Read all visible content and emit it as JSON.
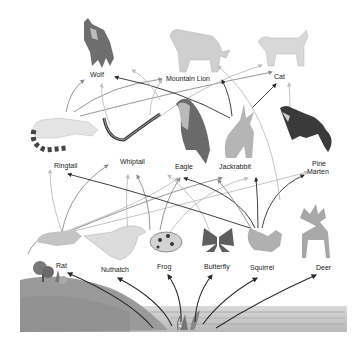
{
  "diagram": {
    "type": "food-web",
    "producer": "Plants",
    "organisms": [
      {
        "id": "wolf",
        "label": "Wolf",
        "level": "top",
        "x": 100,
        "y": 74
      },
      {
        "id": "mountain_lion",
        "label": "Mountain Lion",
        "level": "top",
        "x": 198,
        "y": 78
      },
      {
        "id": "cat",
        "label": "Cat",
        "level": "top",
        "x": 281,
        "y": 76
      },
      {
        "id": "ringtail",
        "label": "Ringtail",
        "level": "secondary",
        "x": 67,
        "y": 165
      },
      {
        "id": "whiptail",
        "label": "Whiptail",
        "level": "secondary",
        "x": 134,
        "y": 161
      },
      {
        "id": "eagle",
        "label": "Eagle",
        "level": "secondary",
        "x": 185,
        "y": 166
      },
      {
        "id": "jackrabbit",
        "label": "Jackrabbit",
        "level": "secondary",
        "x": 233,
        "y": 166
      },
      {
        "id": "pine_marten",
        "label": "Pine\nMarten",
        "level": "secondary",
        "x": 320,
        "y": 168
      },
      {
        "id": "rat",
        "label": "Rat",
        "level": "primary",
        "x": 62,
        "y": 265
      },
      {
        "id": "nuthatch",
        "label": "Nuthatch",
        "level": "primary",
        "x": 116,
        "y": 269
      },
      {
        "id": "frog",
        "label": "Frog",
        "level": "primary",
        "x": 165,
        "y": 266
      },
      {
        "id": "butterfly",
        "label": "Butterfly",
        "level": "primary",
        "x": 216,
        "y": 266
      },
      {
        "id": "squirrel",
        "label": "Squirrel",
        "level": "primary",
        "x": 262,
        "y": 267
      },
      {
        "id": "deer",
        "label": "Deer",
        "level": "primary",
        "x": 322,
        "y": 267
      }
    ],
    "labels": {
      "wolf": "Wolf",
      "mountain_lion": "Mountain Lion",
      "cat": "Cat",
      "ringtail": "Ringtail",
      "whiptail": "Whiptail",
      "eagle": "Eagle",
      "jackrabbit": "Jackrabbit",
      "pine_marten_1": "Pine",
      "pine_marten_2": "Marten",
      "rat": "Rat",
      "nuthatch": "Nuthatch",
      "frog": "Frog",
      "butterfly": "Butterfly",
      "squirrel": "Squirrel",
      "deer": "Deer"
    },
    "edges": [
      {
        "from": "plants",
        "to": "rat"
      },
      {
        "from": "plants",
        "to": "nuthatch"
      },
      {
        "from": "plants",
        "to": "frog"
      },
      {
        "from": "plants",
        "to": "butterfly"
      },
      {
        "from": "plants",
        "to": "squirrel"
      },
      {
        "from": "plants",
        "to": "deer"
      },
      {
        "from": "rat",
        "to": "ringtail"
      },
      {
        "from": "rat",
        "to": "eagle"
      },
      {
        "from": "nuthatch",
        "to": "whiptail"
      },
      {
        "from": "frog",
        "to": "eagle"
      },
      {
        "from": "squirrel",
        "to": "ringtail"
      },
      {
        "from": "squirrel",
        "to": "eagle"
      },
      {
        "from": "squirrel",
        "to": "jackrabbit"
      },
      {
        "from": "squirrel",
        "to": "pine_marten"
      },
      {
        "from": "deer",
        "to": "wolf"
      },
      {
        "from": "deer",
        "to": "mountain_lion"
      },
      {
        "from": "ringtail",
        "to": "wolf"
      },
      {
        "from": "ringtail",
        "to": "mountain_lion"
      },
      {
        "from": "ringtail",
        "to": "cat"
      },
      {
        "from": "jackrabbit",
        "to": "wolf"
      },
      {
        "from": "jackrabbit",
        "to": "mountain_lion"
      },
      {
        "from": "jackrabbit",
        "to": "cat"
      },
      {
        "from": "pine_marten",
        "to": "cat"
      }
    ],
    "colors": {
      "arrow_dark": "#2a2a2a",
      "arrow_mid": "#8a8a8a",
      "arrow_light": "#bdbdbd",
      "ground": "#9a9a9a",
      "water": "#c8c8c8",
      "label_text": "#222222"
    }
  }
}
